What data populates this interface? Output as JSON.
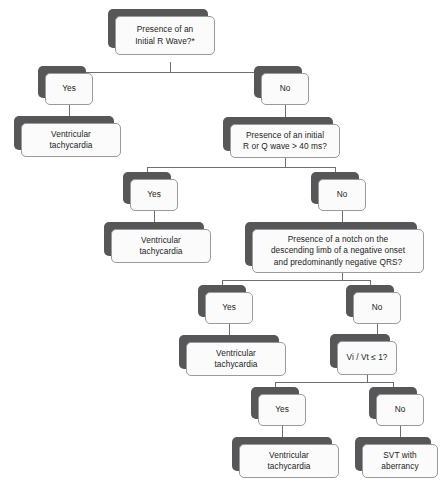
{
  "diagram": {
    "colors": {
      "shadow": "#57575a",
      "box_fill": "#fbfbfb",
      "box_border": "#9a9a9a",
      "line": "#6f6f6f",
      "text": "#1b1b1b",
      "background": "#ffffff"
    }
  },
  "nodes": {
    "q1": "Presence of an\nInitial R Wave?*",
    "q1_yes": "Yes",
    "q1_no": "No",
    "q1_yes_result": "Ventricular\ntachycardia",
    "q2": "Presence of an initial\nR or Q wave > 40 ms?",
    "q2_yes": "Yes",
    "q2_no": "No",
    "q2_yes_result": "Ventricular\ntachycardia",
    "q3": "Presence of a notch on the\ndescending limb of a negative onset\nand predominantly negative QRS?",
    "q3_yes": "Yes",
    "q3_no": "No",
    "q3_yes_result": "Ventricular\ntachycardia",
    "q4": "Vi / Vt ≤ 1?",
    "q4_yes": "Yes",
    "q4_no": "No",
    "q4_yes_result": "Ventricular\ntachycardia",
    "q4_no_result": "SVT with\naberrancy"
  }
}
